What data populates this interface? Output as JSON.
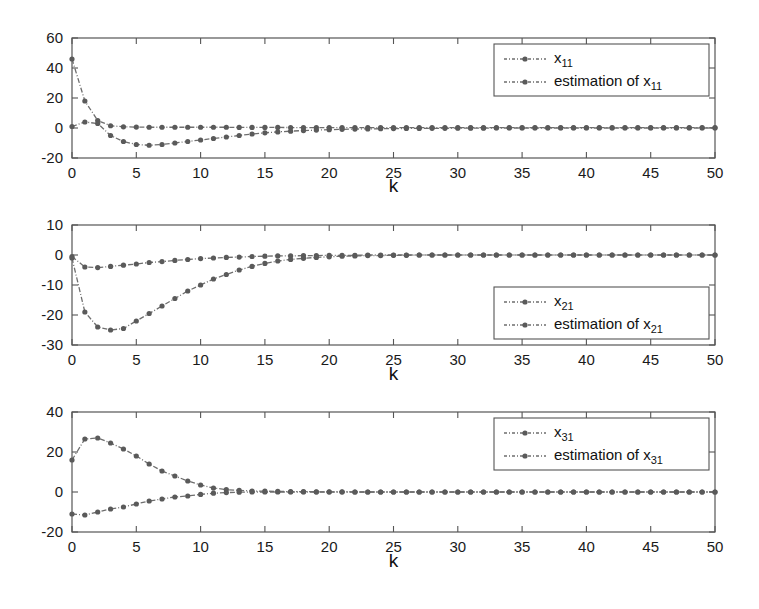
{
  "figure": {
    "background": "#ffffff",
    "line_color": "#6e6e6e",
    "marker_color": "#5a5a5a",
    "axis_color": "#555555"
  },
  "panels": [
    {
      "id": "panel-x11",
      "xlabel": "k",
      "ylabel": "",
      "xticks": [
        "0",
        "5",
        "10",
        "15",
        "20",
        "25",
        "30",
        "35",
        "40",
        "45",
        "50"
      ],
      "yticks": [
        "60",
        "40",
        "20",
        "0",
        "-20"
      ],
      "legend": {
        "position": "top-right",
        "entries": [
          {
            "base": "x",
            "sub": "11",
            "prefix": ""
          },
          {
            "base": "x",
            "sub": "11",
            "prefix": "estimation of "
          }
        ]
      }
    },
    {
      "id": "panel-x21",
      "xlabel": "k",
      "ylabel": "",
      "xticks": [
        "0",
        "5",
        "10",
        "15",
        "20",
        "25",
        "30",
        "35",
        "40",
        "45",
        "50"
      ],
      "yticks": [
        "10",
        "0",
        "-10",
        "-20",
        "-30"
      ],
      "legend": {
        "position": "bottom-right",
        "entries": [
          {
            "base": "x",
            "sub": "21",
            "prefix": ""
          },
          {
            "base": "x",
            "sub": "21",
            "prefix": "estimation of "
          }
        ]
      }
    },
    {
      "id": "panel-x31",
      "xlabel": "k",
      "ylabel": "",
      "xticks": [
        "0",
        "5",
        "10",
        "15",
        "20",
        "25",
        "30",
        "35",
        "40",
        "45",
        "50"
      ],
      "yticks": [
        "40",
        "20",
        "0",
        "-20"
      ],
      "legend": {
        "position": "top-right",
        "entries": [
          {
            "base": "x",
            "sub": "31",
            "prefix": ""
          },
          {
            "base": "x",
            "sub": "31",
            "prefix": "estimation of "
          }
        ]
      }
    }
  ],
  "chart_data": [
    {
      "type": "line",
      "title": "",
      "xlabel": "k",
      "ylabel": "",
      "xlim": [
        0,
        50
      ],
      "ylim": [
        -20,
        60
      ],
      "xticks": [
        0,
        5,
        10,
        15,
        20,
        25,
        30,
        35,
        40,
        45,
        50
      ],
      "yticks": [
        -20,
        0,
        20,
        40,
        60
      ],
      "grid": false,
      "legend_position": "top-right",
      "x": [
        0,
        1,
        2,
        3,
        4,
        5,
        6,
        7,
        8,
        9,
        10,
        11,
        12,
        13,
        14,
        15,
        16,
        17,
        18,
        19,
        20,
        21,
        22,
        23,
        24,
        25,
        26,
        27,
        28,
        29,
        30,
        31,
        32,
        33,
        34,
        35,
        36,
        37,
        38,
        39,
        40,
        41,
        42,
        43,
        44,
        45,
        46,
        47,
        48,
        49,
        50
      ],
      "series": [
        {
          "name": "x_11",
          "values": [
            46,
            18,
            5,
            1.5,
            0.8,
            0.6,
            0.5,
            0.5,
            0.5,
            0.5,
            0.5,
            0.5,
            0.5,
            0.4,
            0.4,
            0.4,
            0.4,
            0.3,
            0.3,
            0.3,
            0.3,
            0.3,
            0.3,
            0.3,
            0.3,
            0.3,
            0.3,
            0.3,
            0.3,
            0.3,
            0.3,
            0.3,
            0.3,
            0.3,
            0.3,
            0.3,
            0.3,
            0.3,
            0.3,
            0.3,
            0.3,
            0.3,
            0.3,
            0.3,
            0.3,
            0.3,
            0.3,
            0.3,
            0.3,
            0.3,
            0.3
          ]
        },
        {
          "name": "estimation of x_11",
          "values": [
            1,
            4,
            3,
            -5,
            -9,
            -11,
            -11.5,
            -11,
            -10,
            -9,
            -8,
            -7,
            -6,
            -5,
            -4,
            -3.2,
            -2.6,
            -2.1,
            -1.7,
            -1.4,
            -1.1,
            -0.9,
            -0.7,
            -0.6,
            -0.5,
            -0.4,
            -0.3,
            -0.3,
            -0.2,
            -0.2,
            -0.1,
            -0.1,
            -0.1,
            0,
            0,
            0,
            0,
            0,
            0,
            0,
            0,
            0,
            0,
            0,
            0,
            0,
            0,
            0,
            0,
            0,
            0
          ]
        }
      ]
    },
    {
      "type": "line",
      "title": "",
      "xlabel": "k",
      "ylabel": "",
      "xlim": [
        0,
        50
      ],
      "ylim": [
        -30,
        10
      ],
      "xticks": [
        0,
        5,
        10,
        15,
        20,
        25,
        30,
        35,
        40,
        45,
        50
      ],
      "yticks": [
        -30,
        -20,
        -10,
        0,
        10
      ],
      "grid": false,
      "legend_position": "bottom-right",
      "x": [
        0,
        1,
        2,
        3,
        4,
        5,
        6,
        7,
        8,
        9,
        10,
        11,
        12,
        13,
        14,
        15,
        16,
        17,
        18,
        19,
        20,
        21,
        22,
        23,
        24,
        25,
        26,
        27,
        28,
        29,
        30,
        31,
        32,
        33,
        34,
        35,
        36,
        37,
        38,
        39,
        40,
        41,
        42,
        43,
        44,
        45,
        46,
        47,
        48,
        49,
        50
      ],
      "series": [
        {
          "name": "x_21",
          "values": [
            -0.5,
            -4,
            -4.2,
            -3.8,
            -3.4,
            -3,
            -2.5,
            -2.2,
            -1.8,
            -1.5,
            -1.2,
            -1,
            -0.8,
            -0.7,
            -0.5,
            -0.4,
            -0.3,
            -0.3,
            -0.2,
            -0.2,
            -0.1,
            -0.1,
            -0.1,
            0,
            0,
            0,
            0,
            0,
            0,
            0,
            0,
            0,
            0,
            0,
            0,
            0,
            0,
            0,
            0,
            0,
            0,
            0,
            0,
            0,
            0,
            0,
            0,
            0,
            0,
            0,
            0
          ]
        },
        {
          "name": "estimation of x_21",
          "values": [
            -1,
            -19,
            -24,
            -25,
            -24.5,
            -22,
            -19.5,
            -17,
            -14.5,
            -12,
            -10,
            -8,
            -6.5,
            -5,
            -3.8,
            -2.8,
            -2,
            -1.5,
            -1.1,
            -0.8,
            -0.6,
            -0.4,
            -0.3,
            -0.2,
            -0.2,
            -0.1,
            -0.1,
            0,
            0,
            0,
            0,
            0,
            0,
            0,
            0,
            0,
            0,
            0,
            0,
            0,
            0,
            0,
            0,
            0,
            0,
            0,
            0,
            0,
            0,
            0,
            0
          ]
        }
      ]
    },
    {
      "type": "line",
      "title": "",
      "xlabel": "k",
      "ylabel": "",
      "xlim": [
        0,
        50
      ],
      "ylim": [
        -20,
        40
      ],
      "xticks": [
        0,
        5,
        10,
        15,
        20,
        25,
        30,
        35,
        40,
        45,
        50
      ],
      "yticks": [
        -20,
        0,
        20,
        40
      ],
      "grid": false,
      "legend_position": "top-right",
      "x": [
        0,
        1,
        2,
        3,
        4,
        5,
        6,
        7,
        8,
        9,
        10,
        11,
        12,
        13,
        14,
        15,
        16,
        17,
        18,
        19,
        20,
        21,
        22,
        23,
        24,
        25,
        26,
        27,
        28,
        29,
        30,
        31,
        32,
        33,
        34,
        35,
        36,
        37,
        38,
        39,
        40,
        41,
        42,
        43,
        44,
        45,
        46,
        47,
        48,
        49,
        50
      ],
      "series": [
        {
          "name": "x_31",
          "values": [
            16,
            26.5,
            27,
            24.5,
            21.5,
            18,
            14,
            10.5,
            8,
            5.5,
            3.5,
            2,
            1.2,
            0.8,
            0.5,
            0.4,
            0.3,
            0.2,
            0.2,
            0.1,
            0.1,
            0.1,
            0,
            0,
            0,
            0,
            0,
            0,
            0,
            0,
            0,
            0,
            0,
            0,
            0,
            0,
            0,
            0,
            0,
            0,
            0,
            0,
            0,
            0,
            0,
            0,
            0,
            0,
            0,
            0,
            0
          ]
        },
        {
          "name": "estimation of x_31",
          "values": [
            -11,
            -11.5,
            -10,
            -8.5,
            -7.5,
            -6,
            -4.5,
            -3.5,
            -2.5,
            -2,
            -1.2,
            -0.6,
            -0.3,
            -0.1,
            0,
            0,
            0,
            0,
            0,
            0,
            0,
            0,
            0,
            0,
            0,
            0,
            0,
            0,
            0,
            0,
            0,
            0,
            0,
            0,
            0,
            0,
            0,
            0,
            0,
            0,
            0,
            0,
            0,
            0,
            0,
            0,
            0,
            0,
            0,
            0,
            0
          ]
        }
      ]
    }
  ]
}
